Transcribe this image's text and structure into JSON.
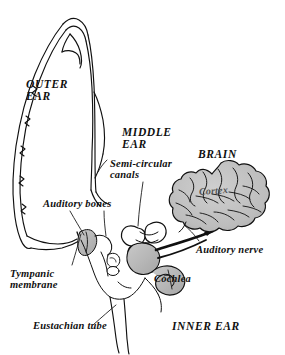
{
  "figure": {
    "background_color": "#ffffff",
    "ink_color": "#101010",
    "shade_color": "#b8b8b8",
    "brain_shade_color": "#bdbdbd"
  },
  "labels": {
    "outer_ear": "OUTER\nEAR",
    "middle_ear": "MIDDLE\nEAR",
    "semicircular_canals": "Semi-circular\ncanals",
    "brain": "BRAIN",
    "cortex": "Cortex",
    "auditory_bones": "Auditory bones",
    "auditory_nerve": "Auditory nerve",
    "cochlea": "Cochlea",
    "tympanic_membrane": "Tympanic\nmembrane",
    "eustachian_tube": "Eustachian tube",
    "inner_ear": "INNER EAR"
  },
  "structures": [
    "pinna-outline",
    "ear-canal",
    "tympanic-membrane",
    "auditory-ossicles",
    "semicircular-canals",
    "cochlea",
    "auditory-nerve",
    "eustachian-tube",
    "brain-cortex"
  ]
}
